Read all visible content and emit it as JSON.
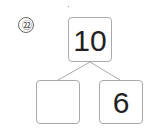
{
  "problem": {
    "number_label": "㉒",
    "top_value": "10",
    "bottom_left_value": "",
    "bottom_right_value": "6"
  }
}
